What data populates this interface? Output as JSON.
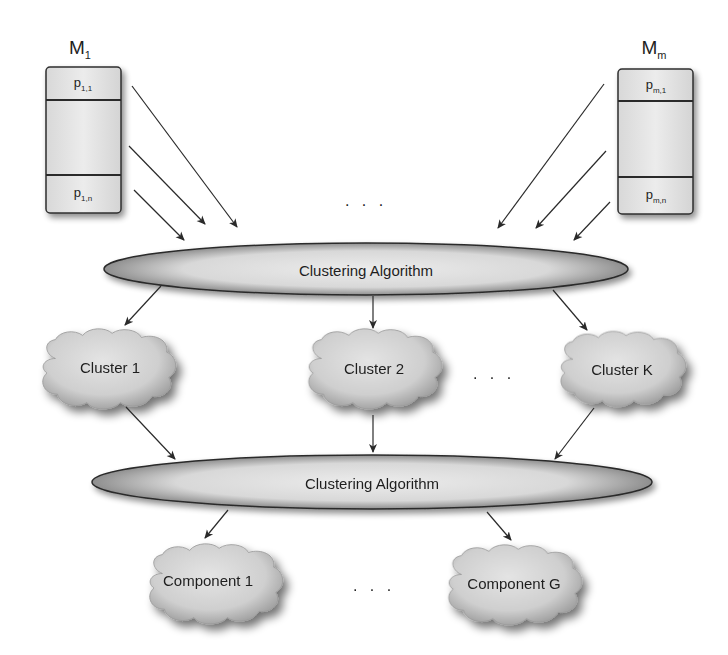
{
  "diagram": {
    "type": "two-stage clustering flow",
    "models": [
      {
        "label": "M",
        "subscript": "1",
        "partitions": [
          {
            "label": "p",
            "subscript": "1,1"
          },
          {
            "label": "p",
            "subscript": "1,n"
          }
        ]
      },
      {
        "label": "M",
        "subscript": "m",
        "partitions": [
          {
            "label": "p",
            "subscript": "m,1"
          },
          {
            "label": "p",
            "subscript": "m,n"
          }
        ]
      }
    ],
    "model_ellipsis": ". . .",
    "stage1": {
      "label": "Clustering Algorithm"
    },
    "clusters": [
      {
        "label": "Cluster 1"
      },
      {
        "label": "Cluster 2"
      },
      {
        "label": "Cluster K"
      }
    ],
    "cluster_ellipsis": ". . .",
    "stage2": {
      "label": "Clustering Algorithm"
    },
    "components": [
      {
        "label": "Component 1"
      },
      {
        "label": "Component G"
      }
    ],
    "component_ellipsis": ". . .",
    "colors": {
      "stroke": "#2a2a2a",
      "box_fill": "#e6e6e6",
      "ellipse_light": "#e8e8e8",
      "ellipse_dark": "#8f8f8f",
      "cloud_fill": "#d2d2d2"
    }
  }
}
